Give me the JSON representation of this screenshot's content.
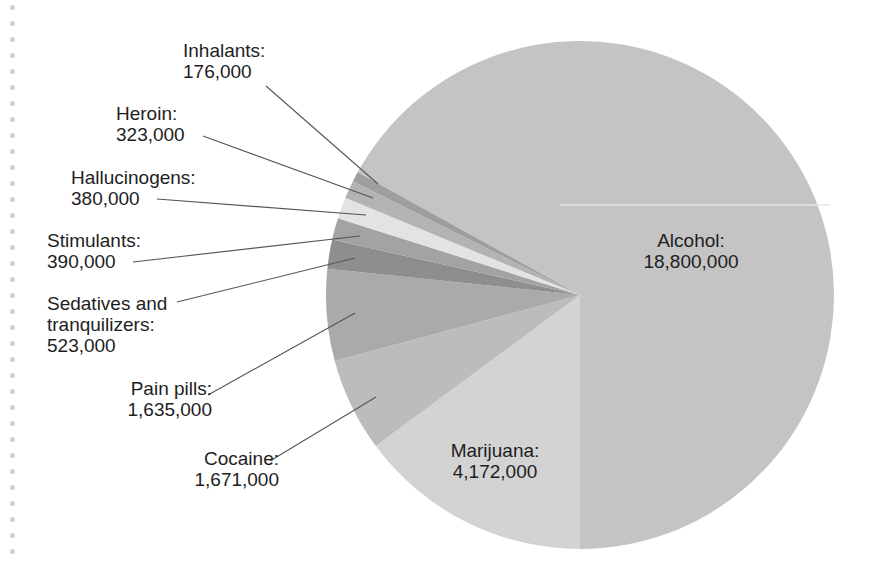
{
  "chart_data": {
    "type": "pie",
    "title": "",
    "unit": "people",
    "categories": [
      "Alcohol",
      "Marijuana",
      "Cocaine",
      "Pain pills",
      "Sedatives and tranquilizers",
      "Stimulants",
      "Hallucinogens",
      "Heroin",
      "Inhalants"
    ],
    "values": [
      18800000,
      4172000,
      1671000,
      1635000,
      523000,
      390000,
      380000,
      323000,
      176000
    ],
    "colors": [
      "#c4c4c4",
      "#d3d3d3",
      "#bcbcbc",
      "#aaaaaa",
      "#8e8e8e",
      "#a3a3a3",
      "#e3e3e3",
      "#b3b3b3",
      "#9e9e9e"
    ],
    "legend_position": "none (callout labels)"
  },
  "labels": {
    "alcohol": {
      "name": "Alcohol:",
      "value": "18,800,000"
    },
    "marijuana": {
      "name": "Marijuana:",
      "value": "4,172,000"
    },
    "cocaine": {
      "name": "Cocaine:",
      "value": "1,671,000"
    },
    "pain_pills": {
      "name": "Pain pills:",
      "value": "1,635,000"
    },
    "sedatives": {
      "name1": "Sedatives and",
      "name2": "tranquilizers:",
      "value": "523,000"
    },
    "stimulants": {
      "name": "Stimulants:",
      "value": "390,000"
    },
    "hallucinogens": {
      "name": "Hallucinogens:",
      "value": "380,000"
    },
    "heroin": {
      "name": "Heroin:",
      "value": "323,000"
    },
    "inhalants": {
      "name": "Inhalants:",
      "value": "176,000"
    }
  }
}
